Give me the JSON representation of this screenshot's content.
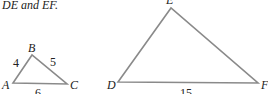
{
  "caption": "DE and EF.",
  "triangle_small": {
    "vertices": {
      "A": "A",
      "B": "B",
      "C": "C"
    },
    "sides": {
      "AB": "4",
      "BC": "5",
      "AC": "6"
    }
  },
  "triangle_large": {
    "vertices": {
      "D": "D",
      "E": "E",
      "F": "F"
    },
    "sides": {
      "DF": "15"
    }
  },
  "colors": {
    "stroke": "#8a8a8a",
    "text": "#222222"
  }
}
